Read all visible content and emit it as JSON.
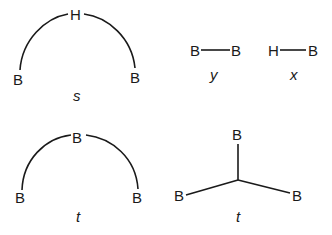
{
  "diagrams": [
    {
      "id": "s",
      "label": "s",
      "type": "three-center-arc",
      "atoms": [
        "B",
        "H",
        "B"
      ]
    },
    {
      "id": "y",
      "label": "y",
      "type": "two-center-bond",
      "atoms": [
        "B",
        "B"
      ]
    },
    {
      "id": "x",
      "label": "x",
      "type": "two-center-bond",
      "atoms": [
        "H",
        "B"
      ]
    },
    {
      "id": "t_open",
      "label": "t",
      "type": "three-center-arc",
      "atoms": [
        "B",
        "B",
        "B"
      ]
    },
    {
      "id": "t_closed",
      "label": "t",
      "type": "three-center-star",
      "atoms": [
        "B",
        "B",
        "B"
      ]
    }
  ]
}
